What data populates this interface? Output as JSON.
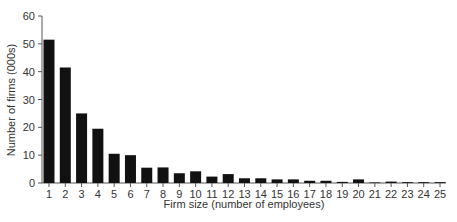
{
  "chart_data": {
    "type": "bar",
    "title": "",
    "xlabel": "Firm size (number of employees)",
    "ylabel": "Number of firms (000s)",
    "ylim": [
      0,
      60
    ],
    "yticks": [
      0,
      10,
      20,
      30,
      40,
      50,
      60
    ],
    "grid": false,
    "legend": null,
    "categories": [
      "1",
      "2",
      "3",
      "4",
      "5",
      "6",
      "7",
      "8",
      "9",
      "10",
      "11",
      "12",
      "13",
      "14",
      "15",
      "16",
      "17",
      "18",
      "19",
      "20",
      "21",
      "22",
      "23",
      "24",
      "25"
    ],
    "values": [
      51.5,
      41.5,
      25,
      19.5,
      10.5,
      10,
      5.5,
      5.6,
      3.5,
      4.2,
      2.3,
      3.2,
      1.7,
      1.7,
      1.3,
      1.3,
      0.8,
      0.8,
      0.4,
      1.3,
      0.2,
      0.5,
      0.3,
      0.3,
      0.3
    ],
    "bar_color": "#111111",
    "axis_color": "#555555"
  }
}
